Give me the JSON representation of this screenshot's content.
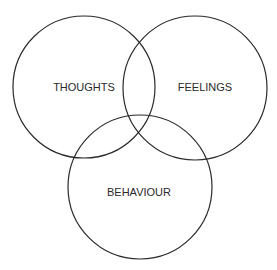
{
  "diagram": {
    "type": "venn",
    "sets": [
      {
        "label": "THOUGHTS",
        "cx": 84,
        "cy": 87,
        "r": 71,
        "lx": 84,
        "ly": 91
      },
      {
        "label": "FEELINGS",
        "cx": 195,
        "cy": 88,
        "r": 72,
        "lx": 205,
        "ly": 91
      },
      {
        "label": "BEHAVIOUR",
        "cx": 140,
        "cy": 187,
        "r": 72,
        "lx": 139,
        "ly": 196
      }
    ],
    "stroke_color": "#2a2a2a",
    "background": "#ffffff"
  }
}
